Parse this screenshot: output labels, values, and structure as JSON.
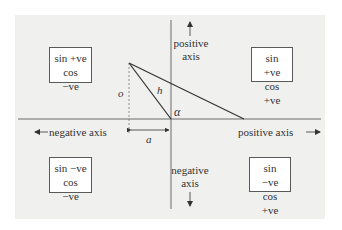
{
  "diagram": {
    "quadrants": {
      "top_left": {
        "line1": "sin +ve",
        "line2": "cos −ve"
      },
      "top_right": {
        "line1": "sin +ve",
        "line2": "cos +ve"
      },
      "bottom_left": {
        "line1": "sin −ve",
        "line2": "cos −ve"
      },
      "bottom_right": {
        "line1": "sin −ve",
        "line2": "cos +ve"
      }
    },
    "axes": {
      "vertical_positive": {
        "line1": "positive",
        "line2": "axis"
      },
      "vertical_negative": {
        "line1": "negative",
        "line2": "axis"
      },
      "horizontal_negative": "negative axis",
      "horizontal_positive": "positive axis"
    },
    "triangle_labels": {
      "opposite": "o",
      "hypotenuse": "h",
      "adjacent": "a",
      "angle": "α"
    },
    "colors": {
      "panel_bg": "#f0f0ef",
      "line": "#3a3a3a",
      "axis": "#6a6a6a",
      "box_border": "#5a5a5a"
    }
  }
}
